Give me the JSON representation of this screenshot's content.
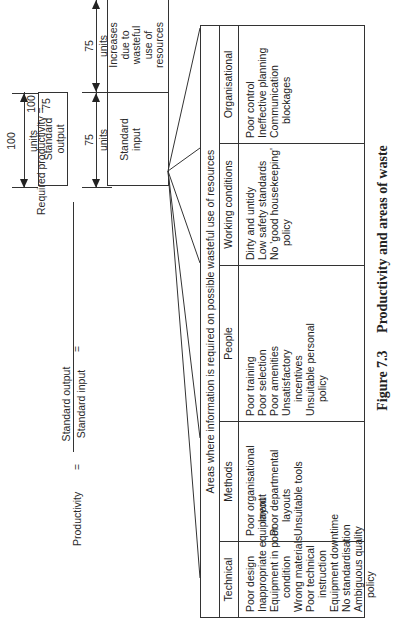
{
  "formula": {
    "productivity_label": "Productivity",
    "equals": "=",
    "numerator": "Standard output",
    "denominator": "Standard input"
  },
  "diagram": {
    "output_dimension": "100",
    "output_unit": "units",
    "output_box_line1": "Standard",
    "output_box_line2": "output",
    "input_dimension_1": "75",
    "input_unit_1": "units",
    "input_dimension_2": "75",
    "input_unit_2": "units",
    "input_box_line1": "Standard",
    "input_box_line2": "input",
    "waste_box_lines": [
      "Increases",
      "due to",
      "wasteful",
      "use of",
      "resources"
    ]
  },
  "required": {
    "label": "Required productivity =",
    "numerator": "100",
    "denominator": "75",
    "operator": "×",
    "rest": "100 = 133%"
  },
  "actual": {
    "label": "Actual productivity =",
    "numerator": "100",
    "denominator": "150",
    "operator": "×",
    "rest": "100 = 66%"
  },
  "table": {
    "header": "Areas where information is required on possible wasteful use of resources",
    "columns": [
      {
        "title": "Technical",
        "items": [
          {
            "text": "Poor design",
            "indent": false
          },
          {
            "text": "Inappropriate equipment",
            "indent": false
          },
          {
            "text": "Equipment in poor",
            "indent": false
          },
          {
            "text": "condition",
            "indent": true
          },
          {
            "text": "Wrong materials",
            "indent": false
          },
          {
            "text": "Poor technical",
            "indent": false
          },
          {
            "text": "instruction",
            "indent": true
          },
          {
            "text": "Equipment downtime",
            "indent": false
          },
          {
            "text": "No standardisation",
            "indent": false
          },
          {
            "text": "Ambiguous quality",
            "indent": false
          },
          {
            "text": "policy",
            "indent": true
          }
        ]
      },
      {
        "title": "Methods",
        "items": [
          {
            "text": "Poor organisational",
            "indent": false
          },
          {
            "text": "layout",
            "indent": true
          },
          {
            "text": "Poor departmental",
            "indent": false
          },
          {
            "text": "layouts",
            "indent": true
          },
          {
            "text": "Unsuitable tools",
            "indent": false
          }
        ]
      },
      {
        "title": "People",
        "items": [
          {
            "text": "Poor training",
            "indent": false
          },
          {
            "text": "Poor selection",
            "indent": false
          },
          {
            "text": "Poor amenities",
            "indent": false
          },
          {
            "text": "Unsatisfactory",
            "indent": false
          },
          {
            "text": "incentives",
            "indent": true
          },
          {
            "text": "Unsuitable personal",
            "indent": false
          },
          {
            "text": "policy",
            "indent": true
          }
        ]
      },
      {
        "title": "Working conditions",
        "items": [
          {
            "text": "Dirty and untidy",
            "indent": false
          },
          {
            "text": "Low safety standards",
            "indent": false
          },
          {
            "text": "No 'good housekeeping'",
            "indent": false
          },
          {
            "text": "policy",
            "indent": true
          }
        ]
      },
      {
        "title": "Organisational",
        "items": [
          {
            "text": "Poor control",
            "indent": false
          },
          {
            "text": "Ineffective planning",
            "indent": false
          },
          {
            "text": "Communication",
            "indent": false
          },
          {
            "text": "blockages",
            "indent": true
          }
        ]
      }
    ]
  },
  "caption": {
    "number": "Figure 7.3",
    "title": "Productivity and areas of waste"
  }
}
